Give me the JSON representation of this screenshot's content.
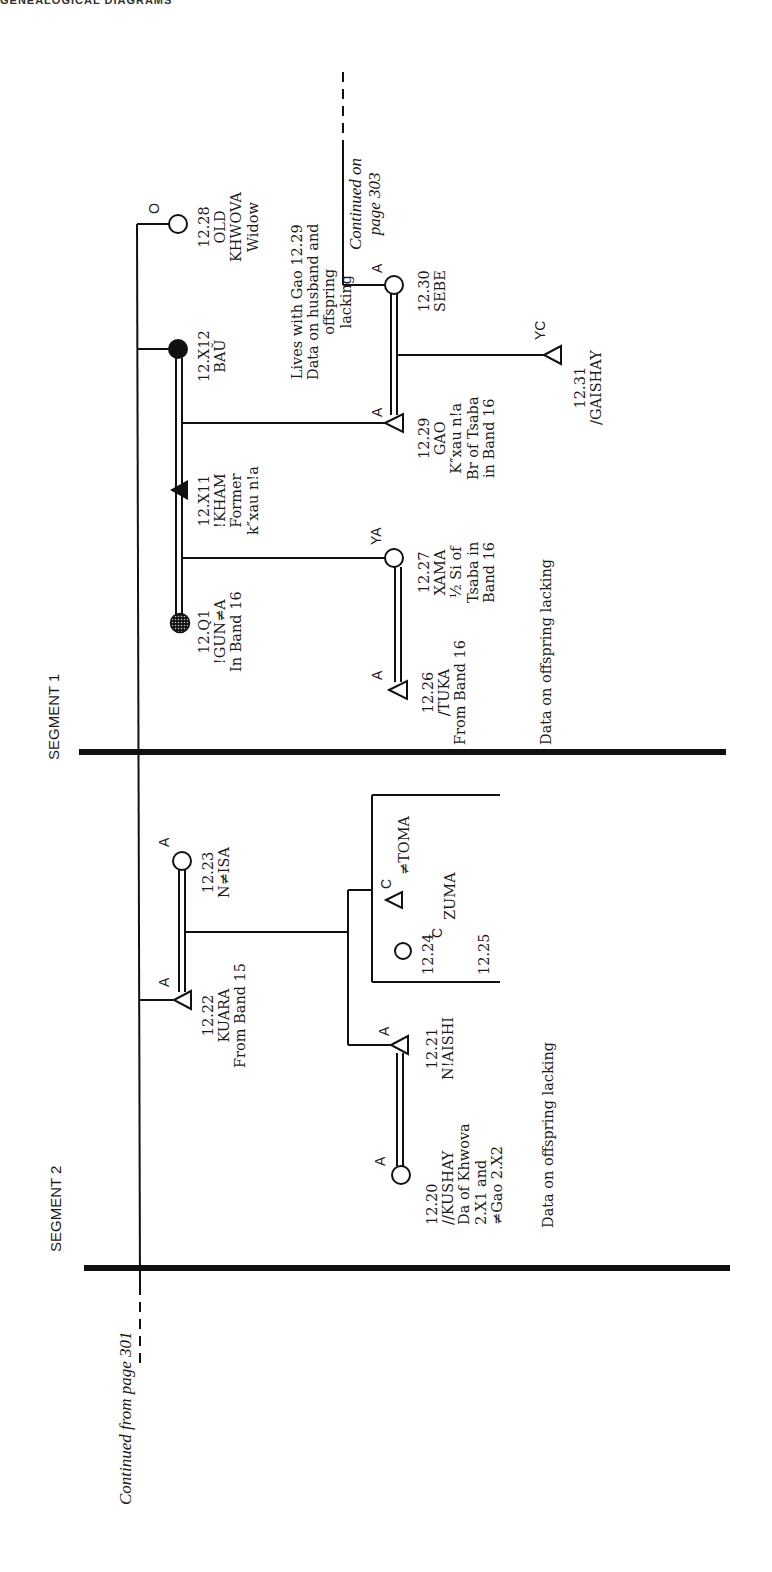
{
  "page": {
    "header_cut_text": "GENEALOGICAL DIAGRAMS",
    "continued_from": "Continued from page 301",
    "continued_on": "Continued on\npage 303"
  },
  "segments": [
    {
      "label": "SEGMENT 1"
    },
    {
      "label": "SEGMENT 2"
    }
  ],
  "people": {
    "p1228": {
      "code": "O",
      "id": "12.28",
      "text": "12.28\nOLD\nKHWOVA\nWidow",
      "shape": "circle-open"
    },
    "p12X12": {
      "id": "12.X12",
      "text": "12.X12\nBAŬ",
      "shape": "circle-filled"
    },
    "p12X11": {
      "id": "12.X11",
      "text": "12.X11\n!KHAM\nFormer\nk″xau n!a",
      "shape": "triangle-filled"
    },
    "p12Q1": {
      "id": "12.Q1",
      "text": "12.Q1\n!GUN≠A\nIn Band 16",
      "shape": "circle-dotted"
    },
    "p1230": {
      "code": "A",
      "id": "12.30",
      "text": "12.30\nSEBE",
      "shape": "circle-open"
    },
    "p1229": {
      "code": "A",
      "id": "12.29",
      "text": "12.29\nGAO\nK″xau n!a\nBr of Tsaba\nin Band 16",
      "shape": "triangle-open"
    },
    "p1231": {
      "code": "YC",
      "id": "12.31",
      "text": "12.31\n/GAISHAY",
      "shape": "triangle-open"
    },
    "p1227": {
      "code": "YA",
      "id": "12.27",
      "text": "12.27\nXAMA\n½ Si of\nTsaba in\nBand 16",
      "shape": "circle-open"
    },
    "p1226": {
      "code": "A",
      "id": "12.26",
      "text": "12.26\n/TUKA\nFrom Band 16",
      "shape": "triangle-open"
    },
    "p1223": {
      "code": "A",
      "id": "12.23",
      "text": "12.23\nN≠ISA",
      "shape": "circle-open"
    },
    "p1222": {
      "code": "A",
      "id": "12.22",
      "text": "12.22\nKUARA\nFrom Band 15",
      "shape": "triangle-open"
    },
    "p1224": {
      "code": "C",
      "id": "12.24",
      "name": "≠TOMA",
      "shape": "triangle-open"
    },
    "p1225": {
      "code": "C",
      "id": "12.25",
      "name": "ZUMA",
      "shape": "circle-open"
    },
    "p1221": {
      "code": "A",
      "id": "12.21",
      "text": "12.21\nN!AISHI",
      "shape": "triangle-open"
    },
    "p1220": {
      "code": "A",
      "id": "12.20",
      "text": "12.20\n//KUSHAY\nDa of Khwova\n2.X1 and\n≠Gao 2.X2",
      "shape": "circle-open"
    }
  },
  "notes": {
    "sebe_note": "Lives with Gao 12.29\nData on husband and\noffspring\nlacking",
    "seg1_offspring": "Data on offspring lacking",
    "seg2_offspring": "Data on offspring lacking"
  }
}
